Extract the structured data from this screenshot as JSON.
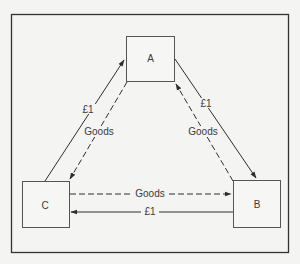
{
  "diagram": {
    "type": "circular-flow-triangle",
    "nodes": [
      {
        "id": "A",
        "label": "A"
      },
      {
        "id": "B",
        "label": "B"
      },
      {
        "id": "C",
        "label": "C"
      }
    ],
    "flows": [
      {
        "from": "C",
        "to": "A",
        "label": "£1",
        "style": "solid"
      },
      {
        "from": "A",
        "to": "C",
        "label": "Goods",
        "style": "dashed"
      },
      {
        "from": "A",
        "to": "B",
        "label": "£1",
        "style": "solid"
      },
      {
        "from": "B",
        "to": "A",
        "label": "Goods",
        "style": "dashed"
      },
      {
        "from": "C",
        "to": "B",
        "label": "Goods",
        "style": "dashed"
      },
      {
        "from": "B",
        "to": "C",
        "label": "£1",
        "style": "solid"
      }
    ],
    "colors": {
      "background": "#f4f4f2",
      "line": "#2e2e2e",
      "box": "#555555",
      "text": "#3a3a3a"
    }
  }
}
